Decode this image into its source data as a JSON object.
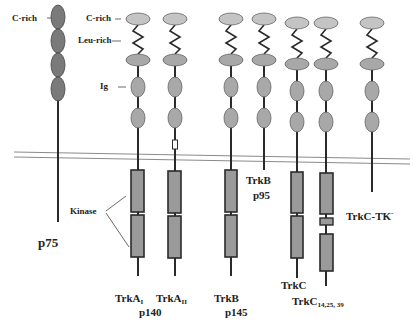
{
  "figure": {
    "domain_labels": {
      "c_rich_p75": "C-rich",
      "c_rich": "C-rich",
      "leu_rich": "Leu-rich",
      "ig": "Ig",
      "kinase": "Kinase"
    },
    "receptors": [
      {
        "id": "p75",
        "label": "p75",
        "sublabel": ""
      },
      {
        "id": "trkA1",
        "label": "TrkA",
        "subscript": "I",
        "sublabel": "p140"
      },
      {
        "id": "trkA2",
        "label": "TrkA",
        "subscript": "II",
        "sublabel": ""
      },
      {
        "id": "trkB",
        "label": "TrkB",
        "sublabel": "p145"
      },
      {
        "id": "trkB95",
        "label": "TrkB",
        "sublabel": "p95"
      },
      {
        "id": "trkC",
        "label": "TrkC",
        "sublabel": ""
      },
      {
        "id": "trkC14",
        "label": "TrkC",
        "subscript": "14,25, 39",
        "sublabel": ""
      },
      {
        "id": "trkCTK",
        "label": "TrkC-TK",
        "superscript": "-",
        "sublabel": ""
      }
    ],
    "colors": {
      "ellipse_light": "#c4c4c4",
      "ellipse_mid": "#a8a8a8",
      "ellipse_dark": "#7a7a7a",
      "kinase_fill": "#9a9a9a",
      "stroke": "#2a2a2a",
      "membrane": "#8a8a8a"
    }
  }
}
